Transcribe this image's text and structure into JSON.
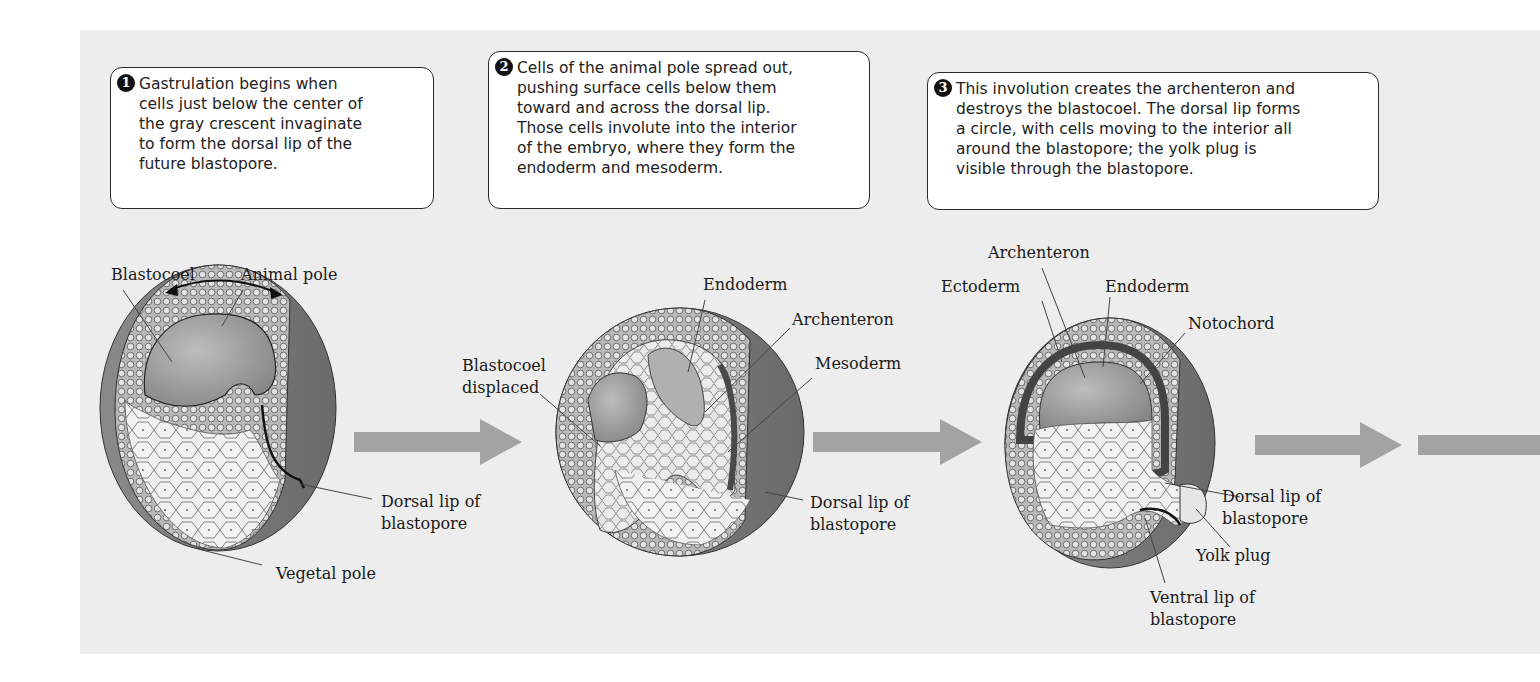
{
  "steps": [
    {
      "number": "1",
      "text": "Gastrulation begins when\ncells just below the center of\nthe gray crescent invaginate\nto form the dorsal lip of the\nfuture blastopore."
    },
    {
      "number": "2",
      "text": "Cells of the animal pole spread out,\npushing surface cells below them\ntoward and across the dorsal lip.\nThose cells involute into the interior\nof the embryo, where they form the\nendoderm and mesoderm."
    },
    {
      "number": "3",
      "text": "This involution creates the archenteron and\ndestroys the blastocoel. The dorsal lip forms\na circle, with cells moving to the interior all\naround the blastopore; the yolk plug is\nvisible through the blastopore."
    }
  ],
  "embryo1": {
    "labels": {
      "blastocoel": "Blastocoel",
      "animal_pole": "Animal pole",
      "dorsal_lip": "Dorsal lip of\nblastopore",
      "vegetal_pole": "Vegetal pole"
    }
  },
  "embryo2": {
    "labels": {
      "endoderm": "Endoderm",
      "archenteron": "Archenteron",
      "mesoderm": "Mesoderm",
      "blastocoel_displaced": "Blastocoel\ndisplaced",
      "dorsal_lip": "Dorsal lip of\nblastopore"
    }
  },
  "embryo3": {
    "labels": {
      "archenteron": "Archenteron",
      "ectoderm": "Ectoderm",
      "endoderm": "Endoderm",
      "notochord": "Notochord",
      "dorsal_lip": "Dorsal lip of\nblastopore",
      "yolk_plug": "Yolk plug",
      "ventral_lip": "Ventral lip of\nblastopore"
    }
  },
  "colors": {
    "panel": "#ededed",
    "arrow": "#a3a3a3",
    "embryo_dark": "#6a6a6a",
    "embryo_mid": "#9a9a9a",
    "embryo_light": "#dcdcdc"
  }
}
